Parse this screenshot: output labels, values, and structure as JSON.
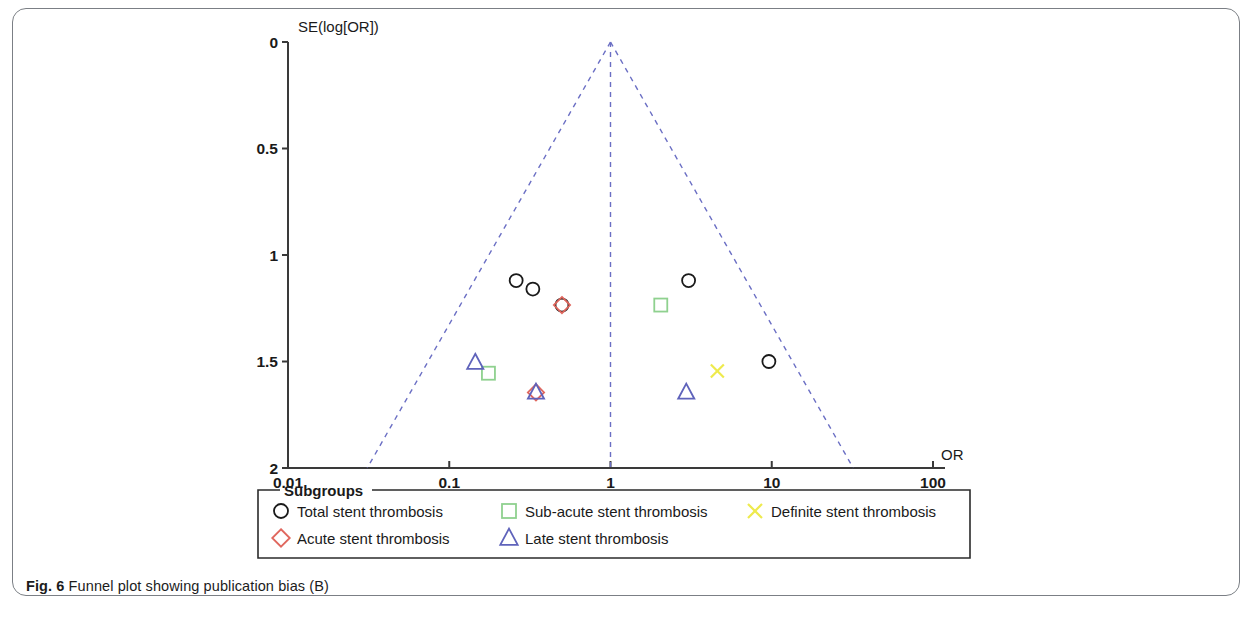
{
  "figure": {
    "caption_prefix": "Fig. 6",
    "caption_text": "Funnel plot showing publication bias (B)"
  },
  "chart_data": {
    "type": "scatter",
    "title": "",
    "subtitle": "",
    "xlabel": "OR",
    "ylabel": "SE(log[OR])",
    "x_scale": "log",
    "xlim": [
      0.01,
      100
    ],
    "ylim": [
      2,
      0
    ],
    "y_inverted": true,
    "grid": false,
    "xticks": [
      "0.01",
      "0.1",
      "1",
      "10",
      "100"
    ],
    "xtick_values": [
      0.01,
      0.1,
      1,
      10,
      100
    ],
    "yticks": [
      "0",
      "0.5",
      "1",
      "1.5",
      "2"
    ],
    "ytick_values": [
      0,
      0.5,
      1,
      1.5,
      2
    ],
    "funnel": {
      "apex_or": 1.0,
      "apex_se": 0.0,
      "left_base_or": 0.031,
      "right_base_or": 32.0,
      "base_se": 2.0,
      "center_line_or": 1.0,
      "line_color": "#6b6fc4",
      "line_style": "dashed"
    },
    "legend": {
      "title": "Subgroups",
      "position": "below-axes",
      "entries": [
        {
          "label": "Total stent thrombosis",
          "marker": "circle",
          "color": "#1a1a1a"
        },
        {
          "label": "Sub-acute stent thrombosis",
          "marker": "square",
          "color": "#8fd18f"
        },
        {
          "label": "Definite stent thrombosis",
          "marker": "x",
          "color": "#eeea4d"
        },
        {
          "label": "Acute stent thrombosis",
          "marker": "diamond",
          "color": "#e0675e"
        },
        {
          "label": "Late stent thrombosis",
          "marker": "triangle",
          "color": "#5f63bb"
        }
      ]
    },
    "series": [
      {
        "name": "Total stent thrombosis",
        "marker": "circle",
        "color": "#1a1a1a",
        "points": [
          {
            "or": 0.26,
            "se": 1.12
          },
          {
            "or": 0.33,
            "se": 1.16
          },
          {
            "or": 0.5,
            "se": 1.235
          },
          {
            "or": 3.05,
            "se": 1.12
          },
          {
            "or": 9.6,
            "se": 1.5
          }
        ]
      },
      {
        "name": "Sub-acute stent thrombosis",
        "marker": "square",
        "color": "#8fd18f",
        "points": [
          {
            "or": 0.175,
            "se": 1.555
          },
          {
            "or": 2.05,
            "se": 1.235
          }
        ]
      },
      {
        "name": "Definite stent thrombosis",
        "marker": "x",
        "color": "#eeea4d",
        "points": [
          {
            "or": 4.6,
            "se": 1.545
          }
        ]
      },
      {
        "name": "Acute stent thrombosis",
        "marker": "diamond",
        "color": "#e0675e",
        "points": [
          {
            "or": 0.5,
            "se": 1.235
          },
          {
            "or": 0.345,
            "se": 1.645
          }
        ]
      },
      {
        "name": "Late stent thrombosis",
        "marker": "triangle",
        "color": "#5f63bb",
        "points": [
          {
            "or": 0.145,
            "se": 1.505
          },
          {
            "or": 0.345,
            "se": 1.645
          },
          {
            "or": 2.95,
            "se": 1.645
          }
        ]
      }
    ]
  }
}
